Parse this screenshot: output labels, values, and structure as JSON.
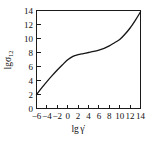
{
  "chart_data": {
    "type": "line",
    "title": "",
    "xlabel": "lg γ̇",
    "xlabel_main": "lg",
    "xlabel_symbol": "γ̇",
    "ylabel": "lgσ12",
    "ylabel_main": "lgσ",
    "ylabel_subscript": "12",
    "xlim": [
      -6,
      14
    ],
    "ylim": [
      0,
      14
    ],
    "xticks": [
      -6,
      -4,
      -2,
      0,
      2,
      4,
      6,
      8,
      10,
      12,
      14
    ],
    "xticklabels": [
      "−6",
      "−4",
      "−2",
      "0",
      "2",
      "4",
      "6",
      "8",
      "10",
      "12",
      "14"
    ],
    "yticks": [
      0,
      2,
      4,
      6,
      8,
      10,
      12,
      14
    ],
    "yticklabels": [
      "0",
      "2",
      "4",
      "6",
      "8",
      "10",
      "12",
      "14"
    ],
    "grid": false,
    "legend": false,
    "tick_direction": "in",
    "series": [
      {
        "name": "flow curve",
        "x": [
          -6,
          -5,
          -4,
          -3,
          -2,
          -1,
          0,
          1,
          2,
          3,
          4,
          5,
          6,
          7,
          8,
          9,
          10,
          11,
          12,
          13,
          14
        ],
        "y": [
          2.0,
          2.95,
          3.85,
          4.7,
          5.5,
          6.25,
          6.95,
          7.45,
          7.7,
          7.85,
          8.0,
          8.15,
          8.35,
          8.6,
          8.95,
          9.4,
          9.85,
          10.6,
          11.5,
          12.6,
          13.8
        ]
      }
    ]
  },
  "colors": {
    "curve": "#151515",
    "axis": "#1a1a1a",
    "background": "#ffffff"
  }
}
